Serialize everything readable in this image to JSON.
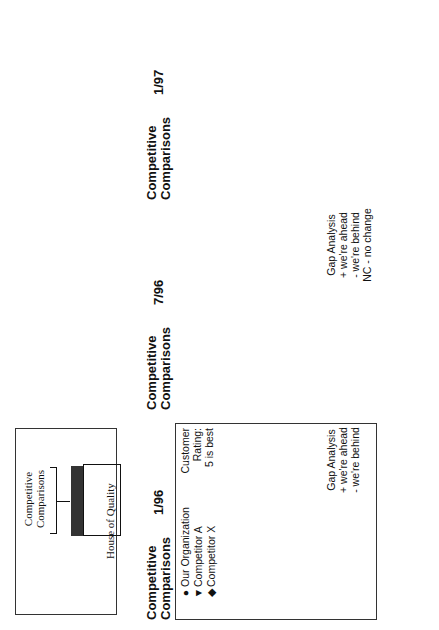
{
  "inset": {
    "label": "Competitive Comparisons",
    "caption": "House of Quality"
  },
  "legend": {
    "items": [
      {
        "symbol": "circle",
        "label": "Our Organization"
      },
      {
        "symbol": "triangle",
        "label": "Competitor A"
      },
      {
        "symbol": "diamond",
        "label": "Competitor X"
      }
    ],
    "rating_title": "Customer Rating:",
    "rating_note": "5 is best",
    "scale": [
      "1",
      "2",
      "3",
      "4",
      "5"
    ]
  },
  "customer_demand_label": "Customer Demand No.",
  "panels": [
    {
      "title": "Competitive Comparisons",
      "date": "1/96",
      "gap_title": "Gap Analysis",
      "gap_notes": [
        "+ we're ahead",
        "- we're behind"
      ],
      "rows": [
        {
          "demand": "1",
          "ours": 3,
          "compA": 3.4,
          "compX": 4,
          "gap": "-1"
        },
        {
          "demand": "2",
          "ours": 4,
          "compA": 4.4,
          "compX": 2,
          "gap": "0"
        },
        {
          "demand": "3",
          "ours": 3,
          "compA": 5,
          "compX": 3.4,
          "gap": "-2"
        },
        {
          "demand": "4",
          "ours": 5,
          "compA": 3,
          "compX": 3.4,
          "gap": "+2"
        },
        {
          "demand": "5",
          "ours": 2,
          "compA": 4,
          "compX": 4.4,
          "gap": "-2"
        },
        {
          "demand": "6",
          "ours": 5,
          "compA": 1,
          "compX": 2,
          "gap": "+3"
        }
      ]
    },
    {
      "title": "Competitive Comparisons",
      "date": "7/96",
      "gap_title": "Gap Analysis",
      "gap_notes": [
        "+ we're ahead",
        "- we're behind",
        "NC - no change"
      ],
      "gap_cols": [
        "New Pos.",
        "Chg."
      ],
      "rows": [
        {
          "ours": 3,
          "compA": 4.4,
          "compX": 4,
          "new_pos": "-1",
          "chg": "NC"
        },
        {
          "ours": 5,
          "compA": 4,
          "compX": 2,
          "new_pos": "+1",
          "chg": "+1"
        },
        {
          "ours": 3,
          "compA": 5,
          "compX": 4,
          "new_pos": "-2",
          "chg": "NC"
        },
        {
          "ours": 5,
          "compA": 4,
          "compX": 4.4,
          "new_pos": "+1",
          "chg": "-1"
        },
        {
          "ours": 3,
          "compA": 4,
          "compX": 4.4,
          "new_pos": "-1",
          "chg": "+1"
        },
        {
          "ours": 5,
          "compA": 3,
          "compX": 2,
          "new_pos": "+2",
          "chg": "-1"
        }
      ]
    },
    {
      "title": "Competitive Comparisons",
      "date": "1/97",
      "gap_notes_partial": [
        "+ we're ahead",
        "- we're behind",
        "NC"
      ],
      "rows": [
        {
          "ours": 4,
          "compA": 4.6,
          "compX": 4.3
        },
        {
          "ours": 5,
          "compA": 4,
          "compX": 3
        },
        {
          "ours": 4,
          "compA": 5,
          "compX": 4.4
        },
        {
          "ours": 5,
          "compA": 4,
          "compX": 4.3
        },
        {
          "ours": 4,
          "compA": 4.6,
          "compX": 4.3
        },
        {
          "ours": 5,
          "compA": 4,
          "compX": 3
        }
      ]
    }
  ]
}
